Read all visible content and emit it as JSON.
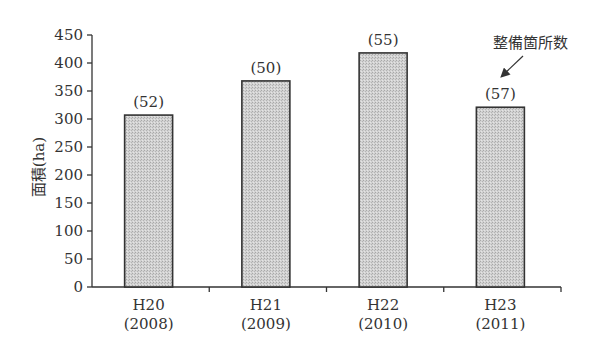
{
  "chart_data": {
    "type": "bar",
    "title": "",
    "xlabel": "",
    "ylabel": "面積(ha)",
    "ylim": [
      0,
      450
    ],
    "yticks": [
      0,
      50,
      100,
      150,
      200,
      250,
      300,
      350,
      400,
      450
    ],
    "grid": false,
    "categories": [
      "H20",
      "H21",
      "H22",
      "H23"
    ],
    "category_sublabels": [
      "(2008)",
      "(2009)",
      "(2010)",
      "(2011)"
    ],
    "values": [
      307,
      368,
      418,
      321
    ],
    "bar_annotations": [
      "(52)",
      "(50)",
      "(55)",
      "(57)"
    ],
    "annotation_label": "整備箇所数",
    "annotation_target_index": 3,
    "bar_color": "#c8c8c8",
    "legend": null
  }
}
